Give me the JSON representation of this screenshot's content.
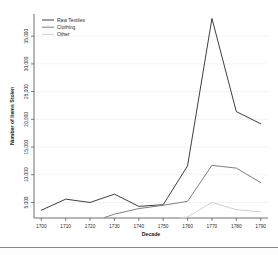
{
  "figure": {
    "background_color": "#ffffff",
    "separator_color": "#8a8a8a"
  },
  "chart_data": {
    "type": "line",
    "title": "",
    "xlabel": "Decade",
    "ylabel": "Number of Items Stolen",
    "categories": [
      1700,
      1710,
      1720,
      1730,
      1740,
      1750,
      1760,
      1770,
      1780,
      1790
    ],
    "x": [
      1700,
      1710,
      1720,
      1730,
      1740,
      1750,
      1760,
      1770,
      1780,
      1790
    ],
    "xlim": [
      1697,
      1793
    ],
    "ylim": [
      2200,
      39000
    ],
    "xticks": [
      1700,
      1710,
      1720,
      1730,
      1740,
      1750,
      1760,
      1770,
      1780,
      1790
    ],
    "xtick_labels": [
      "1700",
      "1710",
      "1720",
      "1730",
      "1740",
      "1750",
      "1760",
      "1770",
      "1780",
      "1790"
    ],
    "yticks": [
      5000,
      10000,
      15000,
      20000,
      25000,
      30000,
      35000
    ],
    "ytick_labels": [
      "5,000",
      "10,000",
      "15,000",
      "20,000",
      "25,000",
      "30,000",
      "35,000"
    ],
    "grid": true,
    "grid_axis": "y",
    "legend_position": "top-left",
    "series": [
      {
        "name": "Raw Textiles",
        "color": "#3f3f3f",
        "x": [
          1700,
          1710,
          1720,
          1730,
          1740,
          1750,
          1760,
          1770,
          1780,
          1790
        ],
        "values": [
          3600,
          5600,
          5000,
          6500,
          4300,
          4600,
          11600,
          38200,
          21400,
          19200
        ]
      },
      {
        "name": "Clothing",
        "color": "#808080",
        "x": [
          1726,
          1730,
          1740,
          1750,
          1760,
          1770,
          1780,
          1790
        ],
        "values": [
          2300,
          2900,
          3900,
          4500,
          5200,
          11700,
          11200,
          8600
        ]
      },
      {
        "name": "Other",
        "color": "#d0d0d0",
        "x": [
          1757,
          1760,
          1770,
          1780,
          1790
        ],
        "values": [
          2200,
          2400,
          5000,
          3700,
          3300
        ]
      }
    ]
  },
  "legend": {
    "items": [
      {
        "label": "Raw Textiles",
        "color": "#3f3f3f"
      },
      {
        "label": "Clothing",
        "color": "#808080"
      },
      {
        "label": "Other",
        "color": "#d0d0d0"
      }
    ]
  }
}
